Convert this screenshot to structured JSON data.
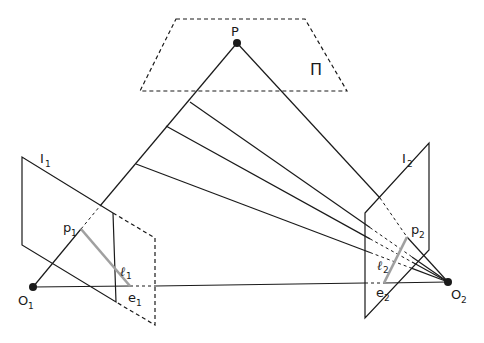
{
  "diagram": {
    "labels": {
      "point_P": "P",
      "plane_pi": "Π",
      "image1": {
        "main": "I",
        "sub": "1"
      },
      "image2": {
        "main": "I",
        "sub": "2"
      },
      "p1": {
        "main": "p",
        "sub": "1"
      },
      "p2": {
        "main": "p",
        "sub": "2"
      },
      "e1": {
        "main": "e",
        "sub": "1"
      },
      "e2": {
        "main": "e",
        "sub": "2"
      },
      "O1": {
        "main": "O",
        "sub": "1"
      },
      "O2": {
        "main": "O",
        "sub": "2"
      },
      "l1": {
        "main": "ℓ",
        "sub": "1"
      },
      "l2": {
        "main": "ℓ",
        "sub": "2"
      }
    },
    "colors": {
      "line": "#1a1a1a",
      "epipolar_line": "#a0a0a0",
      "background": "#ffffff"
    },
    "ray_point_count_between_O1_and_P": 3
  }
}
